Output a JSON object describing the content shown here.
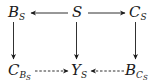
{
  "diagram": {
    "nodes": {
      "bs": {
        "main": "B",
        "sub": "S"
      },
      "s": {
        "main": "S"
      },
      "cs": {
        "main": "C",
        "sub": "S"
      },
      "cbs": {
        "main": "C",
        "sub": "B",
        "subsub": "S"
      },
      "ys": {
        "main": "Y",
        "sub": "S"
      },
      "bcs": {
        "main": "B",
        "sub": "C",
        "subsub": "S"
      }
    },
    "edges": [
      {
        "from": "S",
        "to": "B_S",
        "style": "solid"
      },
      {
        "from": "S",
        "to": "C_S",
        "style": "solid"
      },
      {
        "from": "B_S",
        "to": "C_{B_S}",
        "style": "solid"
      },
      {
        "from": "S",
        "to": "Y_S",
        "style": "solid"
      },
      {
        "from": "C_S",
        "to": "B_{C_S}",
        "style": "solid"
      },
      {
        "from": "C_{B_S}",
        "to": "Y_S",
        "style": "dashed"
      },
      {
        "from": "B_{C_S}",
        "to": "Y_S",
        "style": "dashed"
      }
    ],
    "colors": {
      "stroke": "#1a1a1a",
      "background": "#ffffff"
    }
  }
}
